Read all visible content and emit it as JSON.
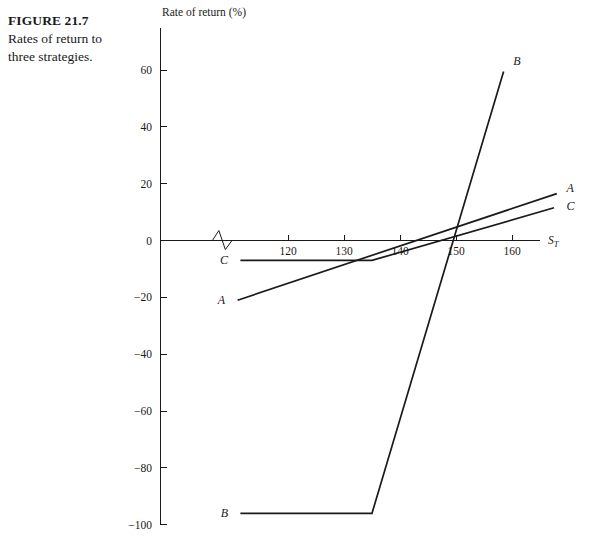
{
  "figure": {
    "number_label": "FIGURE 21.7",
    "caption": "Rates of return to three strategies."
  },
  "chart_data": {
    "type": "line",
    "title": "",
    "xlabel": "S_T",
    "xlabel_base": "S",
    "xlabel_sub": "T",
    "ylabel": "Rate of return (%)",
    "xlim": [
      105,
      168
    ],
    "ylim": [
      -100,
      70
    ],
    "xticks": [
      120,
      130,
      140,
      150,
      160
    ],
    "xtick_labels": [
      "120",
      "130",
      "140",
      "150",
      "160"
    ],
    "yticks": [
      60,
      40,
      20,
      0,
      -20,
      -40,
      -60,
      -80,
      -100
    ],
    "ytick_labels": [
      "60",
      "40",
      "20",
      "0",
      "−20",
      "−40",
      "−60",
      "−80",
      "−100"
    ],
    "grid": false,
    "legend_position": "inline-endpoints",
    "axis_break": {
      "present": true,
      "axis": "x",
      "symbol": "zigzag",
      "x_start": 106.5,
      "x_end": 110.0
    },
    "series": [
      {
        "name": "A",
        "label": "A",
        "label_left": "A",
        "label_right": "A",
        "points": [
          [
            111.0,
            -21.0
          ],
          [
            168.0,
            16.5
          ]
        ]
      },
      {
        "name": "B",
        "label": "B",
        "label_left": "B",
        "label_right": "B",
        "points": [
          [
            111.5,
            -96.0
          ],
          [
            135.0,
            -96.0
          ],
          [
            158.5,
            59.5
          ]
        ]
      },
      {
        "name": "C",
        "label": "C",
        "label_left": "C",
        "label_right": "C",
        "points": [
          [
            111.5,
            -7.0
          ],
          [
            135.0,
            -7.0
          ],
          [
            167.5,
            11.5
          ]
        ]
      }
    ],
    "annotations": [
      {
        "text": "A",
        "x": 109.5,
        "y": -21.0,
        "placement": "left"
      },
      {
        "text": "B",
        "x": 110.0,
        "y": -96.0,
        "placement": "left"
      },
      {
        "text": "C",
        "x": 110.0,
        "y": -7.0,
        "placement": "left"
      },
      {
        "text": "A",
        "x": 169.0,
        "y": 18.5,
        "placement": "right"
      },
      {
        "text": "C",
        "x": 169.0,
        "y": 12.0,
        "placement": "right"
      },
      {
        "text": "B",
        "x": 159.5,
        "y": 63.0,
        "placement": "right"
      }
    ]
  }
}
